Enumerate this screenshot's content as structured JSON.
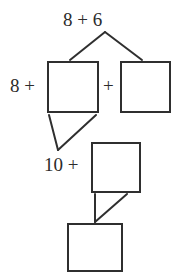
{
  "diagram": {
    "type": "make-a-ten number bond decomposition",
    "background_color": "#ffffff",
    "stroke_color": "#2f2f2f",
    "text_color": "#2b2b2b",
    "labels": {
      "top_expression": "8 + 6",
      "left_addend": "8 +",
      "middle_plus": "+",
      "second_step": "10 +"
    },
    "boxes": [
      {
        "name": "box-decompose-left",
        "value": "",
        "x": 48,
        "y": 62,
        "w": 50,
        "h": 50
      },
      {
        "name": "box-decompose-right",
        "value": "",
        "x": 121,
        "y": 62,
        "w": 49,
        "h": 50
      },
      {
        "name": "box-step-two",
        "value": "",
        "x": 92,
        "y": 143,
        "w": 48,
        "h": 49
      },
      {
        "name": "box-answer",
        "value": "",
        "x": 68,
        "y": 224,
        "w": 54,
        "h": 47
      }
    ],
    "connectors": [
      {
        "name": "branch-top-to-left-box",
        "from": [
          105,
          32
        ],
        "to": [
          70,
          60
        ]
      },
      {
        "name": "branch-top-to-right-box",
        "from": [
          105,
          32
        ],
        "to": [
          142,
          60
        ]
      },
      {
        "name": "branch-left-box-down",
        "from": [
          49,
          115
        ],
        "to": [
          58,
          150
        ]
      },
      {
        "name": "branch-right-of-box-down",
        "from": [
          96,
          115
        ],
        "to": [
          58,
          150
        ]
      },
      {
        "name": "branch-step-two-left",
        "from": [
          95,
          194
        ],
        "to": [
          95,
          222
        ]
      },
      {
        "name": "branch-step-two-right",
        "from": [
          127,
          194
        ],
        "to": [
          95,
          222
        ]
      }
    ]
  }
}
